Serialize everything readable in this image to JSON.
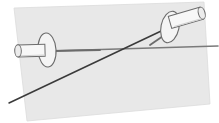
{
  "figure": {
    "canvas": {
      "width": 219,
      "height": 123,
      "background": "#ffffff"
    },
    "colors": {
      "plane_fill": "#e8e8e8",
      "plane_stroke": "#dcdcdc",
      "line_dark": "#3a3a3a",
      "line_gray": "#7a7a7a",
      "pin_fill": "#f4f4f4",
      "pin_fill_shade": "#e0e0e0",
      "pin_stroke": "#6b6b6b",
      "pin_stroke_light": "#9a9a9a"
    },
    "plane": {
      "name": "plane",
      "points": "14,8 204,2 210,104 27,121"
    },
    "lines": [
      {
        "name": "horizontal-line",
        "x1": 17,
        "y1": 52,
        "x2": 218,
        "y2": 46,
        "color": "#7a7a7a",
        "width": 1.6
      },
      {
        "name": "diagonal-line",
        "x1": 9,
        "y1": 103,
        "x2": 176,
        "y2": 24,
        "color": "#3a3a3a",
        "width": 1.5
      }
    ],
    "intersection": {
      "x": 133,
      "y": 48
    },
    "pins": [
      {
        "name": "pin-left",
        "head": {
          "cx": 47,
          "cy": 50,
          "rx": 9,
          "ry": 17,
          "rotate": -4
        },
        "shaft": {
          "x": 16,
          "y": 44,
          "w": 36,
          "h": 13,
          "cap_rx": 3.2,
          "cap_ry": 6.5,
          "rotate": -1
        },
        "tip": {
          "x1": 52,
          "y1": 51,
          "x2": 100,
          "y2": 50
        }
      },
      {
        "name": "pin-right",
        "head": {
          "cx": 170,
          "cy": 27,
          "rx": 9,
          "ry": 16,
          "rotate": 12
        },
        "shaft": {
          "x": 168,
          "y": 13,
          "w": 40,
          "h": 12,
          "cap_rx": 3.2,
          "cap_ry": 6,
          "rotate": -16
        },
        "tip": {
          "x1": 166,
          "y1": 34,
          "x2": 150,
          "y2": 45
        }
      }
    ]
  }
}
